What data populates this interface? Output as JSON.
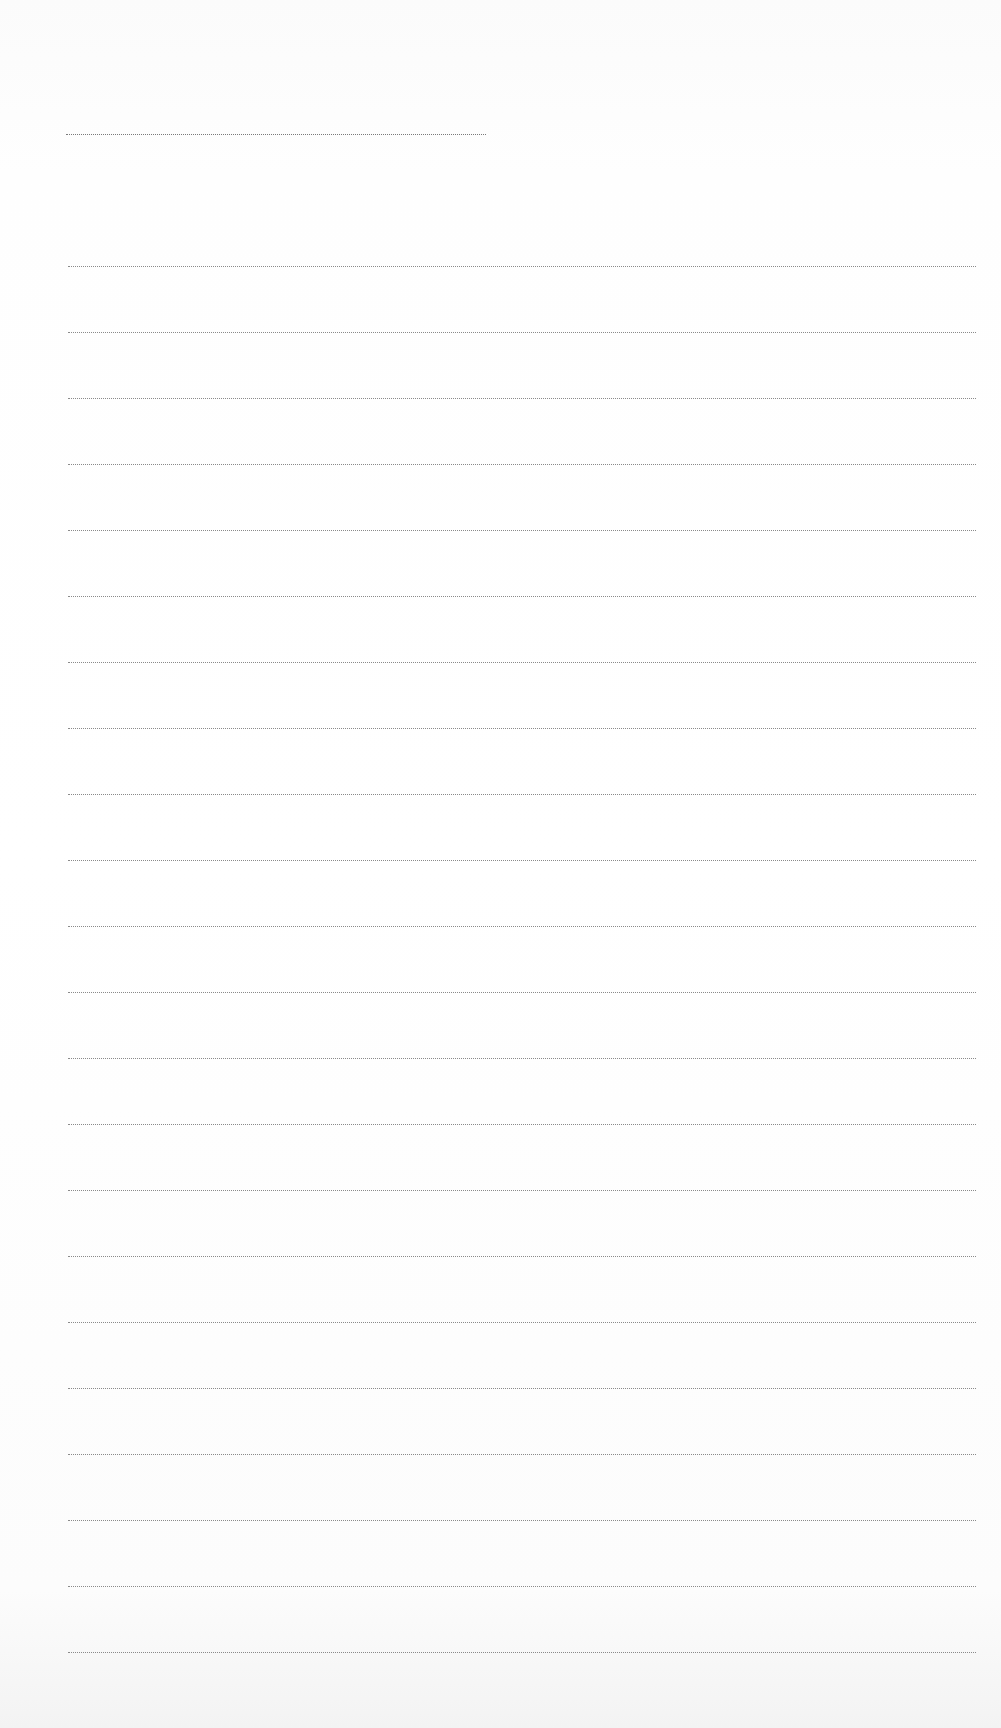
{
  "document": {
    "type": "lined-paper",
    "header_line": {
      "top": 134,
      "left": 66,
      "width": 420
    },
    "rules": {
      "first_top": 266,
      "spacing": 66,
      "count": 22,
      "left": 68,
      "width": 908
    },
    "colors": {
      "background": "#fdfdfd",
      "line": "#8a8a8a"
    }
  }
}
